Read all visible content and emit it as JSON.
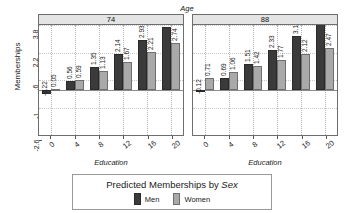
{
  "chart_data": {
    "type": "bar",
    "title": "",
    "cond_label": "Age",
    "xlabel": "Education",
    "ylabel": "Memberships",
    "ylim": [
      -2.6,
      3.8
    ],
    "yticks": [
      "-2.6",
      "-1",
      ".6",
      "2.2",
      "3.8"
    ],
    "ytick_values": [
      -2.6,
      -1,
      0.6,
      2.2,
      3.8
    ],
    "categories": [
      "0",
      "4",
      "8",
      "12",
      "16",
      "20"
    ],
    "grid": true,
    "legend_position": "bottom",
    "panels": [
      {
        "strip": "74",
        "series": [
          {
            "name": "Men",
            "values": [
              -0.22,
              0.56,
              1.35,
              2.14,
              2.93,
              3.71
            ],
            "labels": [
              "-0.22",
              "0.56",
              "1.35",
              "2.14",
              "2.93",
              "3.71"
            ]
          },
          {
            "name": "Women",
            "values": [
              0.05,
              0.59,
              1.13,
              1.67,
              2.21,
              2.74
            ],
            "labels": [
              "0.05",
              "0.59",
              "1.13",
              "1.67",
              "2.21",
              "2.74"
            ]
          }
        ]
      },
      {
        "strip": "88",
        "series": [
          {
            "name": "Men",
            "values": [
              -0.12,
              0.69,
              1.51,
              2.33,
              3.15,
              3.96
            ],
            "labels": [
              "-0.12",
              "0.69",
              "1.51",
              "2.33",
              "3.15",
              "3.96"
            ]
          },
          {
            "name": "Women",
            "values": [
              0.71,
              1.06,
              1.42,
              1.77,
              2.12,
              2.47
            ],
            "labels": [
              "0.71",
              "1.06",
              "1.42",
              "1.77",
              "2.12",
              "2.47"
            ]
          }
        ]
      }
    ]
  },
  "legend": {
    "title_plain": "Predicted Memberships by ",
    "title_italic": "Sex",
    "keys": [
      {
        "label": "Men",
        "color": "#3a3a3a"
      },
      {
        "label": "Women",
        "color": "#a9a9a9"
      }
    ]
  },
  "colors": {
    "men": "#3a3a3a",
    "women": "#a9a9a9",
    "strip_bg": "#e4e4e4",
    "frame": "#6e6e6e",
    "grid": "#b4b4b4",
    "background": "#ffffff"
  }
}
